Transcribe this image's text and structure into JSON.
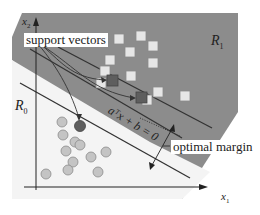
{
  "diagram": {
    "labels": {
      "support_vectors": "support vectors",
      "optimal_margin": "optimal margin",
      "region_1": "R",
      "region_1_sub": "1",
      "region_0": "R",
      "region_0_sub": "0",
      "axis_x": "x",
      "axis_x_sub": "1",
      "axis_y": "x",
      "axis_y_sub": "2",
      "hyperplane_equation": "aᵀx + b = 0"
    },
    "colors": {
      "region_1_fill": "#8c8c8c",
      "region_0_fill": "#f4f4f4",
      "class1_square_fill": "#e6e6e6",
      "class0_circle_fill": "#c4c4c4",
      "support_vector_fill": "#5e5e5e",
      "line": "#3a3a3a"
    },
    "class1_points": [
      [
        141,
        36
      ],
      [
        119,
        39
      ],
      [
        153,
        46
      ],
      [
        102,
        40
      ],
      [
        130,
        52
      ],
      [
        110,
        60
      ],
      [
        153,
        63
      ],
      [
        105,
        71
      ],
      [
        131,
        76
      ],
      [
        101,
        83
      ],
      [
        158,
        92
      ],
      [
        185,
        96
      ],
      [
        147,
        100
      ]
    ],
    "class0_points": [
      [
        48,
        123
      ],
      [
        63,
        126
      ],
      [
        45,
        133
      ],
      [
        55,
        140
      ],
      [
        63,
        142
      ],
      [
        68,
        144
      ],
      [
        43,
        150
      ],
      [
        66,
        152
      ],
      [
        79,
        156
      ],
      [
        98,
        153
      ],
      [
        66,
        162
      ],
      [
        58,
        170
      ],
      [
        93,
        170
      ],
      [
        46,
        171
      ]
    ],
    "support_vectors": [
      [
        112,
        80
      ],
      [
        141,
        97
      ],
      [
        80,
        125
      ]
    ]
  }
}
